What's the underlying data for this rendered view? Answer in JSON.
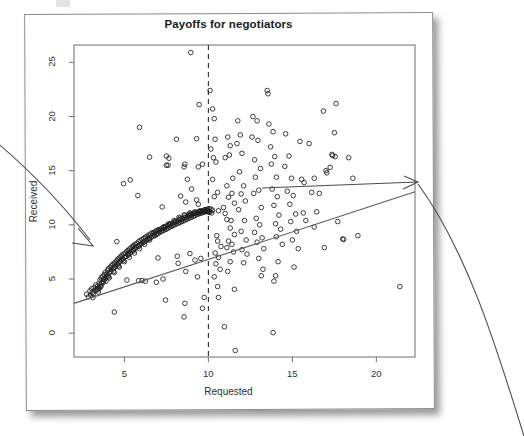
{
  "figure": {
    "title": "Payoffs for negotiators",
    "xlabel": "Requested",
    "ylabel": "Received"
  },
  "annotations": {
    "left_arrow_name": "arrow-pointing-to-dense-cluster",
    "right_arrow_name": "curved-arrow-pointing-to-regression-line"
  },
  "chart_data": {
    "type": "scatter",
    "title": "Payoffs for negotiators",
    "xlabel": "Requested",
    "ylabel": "Received",
    "xlim": [
      2.0,
      22.3
    ],
    "ylim": [
      -2.2,
      26.6
    ],
    "xticks": [
      5,
      10,
      15,
      20
    ],
    "yticks": [
      0,
      5,
      10,
      15,
      20,
      25
    ],
    "grid": false,
    "legend": null,
    "marker": "open-circle",
    "reference_lines": [
      {
        "name": "vertical-dashed-line",
        "orientation": "vertical",
        "x": 10,
        "style": "dashed",
        "color": "#2b2b2b"
      },
      {
        "name": "regression-line",
        "orientation": "linear-fit",
        "style": "solid",
        "color": "#5a5a5a",
        "x_from": 2.0,
        "y_from": 2.75,
        "x_to": 22.3,
        "y_to": 13.05
      }
    ],
    "points": [
      [
        2.75,
        3.6
      ],
      [
        2.85,
        3.35
      ],
      [
        2.95,
        3.9
      ],
      [
        3.0,
        3.5
      ],
      [
        3.05,
        4.1
      ],
      [
        3.1,
        3.75
      ],
      [
        3.12,
        3.3
      ],
      [
        3.2,
        4.2
      ],
      [
        3.25,
        3.95
      ],
      [
        3.3,
        4.45
      ],
      [
        3.35,
        4.05
      ],
      [
        3.4,
        4.35
      ],
      [
        3.45,
        3.8
      ],
      [
        3.5,
        4.6
      ],
      [
        3.52,
        4.15
      ],
      [
        3.55,
        4.9
      ],
      [
        3.6,
        4.4
      ],
      [
        3.62,
        5.1
      ],
      [
        3.65,
        4.6
      ],
      [
        3.7,
        5.25
      ],
      [
        3.72,
        4.8
      ],
      [
        3.75,
        5.0
      ],
      [
        3.8,
        5.4
      ],
      [
        3.82,
        4.95
      ],
      [
        3.85,
        5.6
      ],
      [
        3.9,
        5.2
      ],
      [
        3.95,
        5.45
      ],
      [
        4.0,
        5.8
      ],
      [
        4.02,
        5.3
      ],
      [
        4.05,
        5.95
      ],
      [
        4.1,
        5.55
      ],
      [
        4.15,
        6.05
      ],
      [
        4.2,
        5.7
      ],
      [
        4.22,
        6.2
      ],
      [
        4.25,
        5.9
      ],
      [
        4.3,
        6.35
      ],
      [
        4.35,
        6.0
      ],
      [
        4.4,
        6.4
      ],
      [
        4.42,
        6.1
      ],
      [
        4.45,
        6.55
      ],
      [
        4.5,
        6.2
      ],
      [
        4.55,
        6.7
      ],
      [
        4.6,
        6.35
      ],
      [
        4.62,
        6.85
      ],
      [
        4.65,
        6.5
      ],
      [
        4.7,
        6.95
      ],
      [
        4.75,
        6.6
      ],
      [
        4.8,
        7.05
      ],
      [
        4.82,
        6.75
      ],
      [
        4.85,
        7.2
      ],
      [
        4.9,
        6.85
      ],
      [
        4.95,
        7.3
      ],
      [
        5.0,
        7.0
      ],
      [
        5.05,
        7.4
      ],
      [
        5.1,
        7.1
      ],
      [
        5.15,
        7.55
      ],
      [
        5.2,
        7.25
      ],
      [
        5.22,
        7.65
      ],
      [
        5.25,
        7.35
      ],
      [
        5.3,
        7.75
      ],
      [
        5.35,
        7.45
      ],
      [
        5.4,
        7.9
      ],
      [
        5.45,
        7.6
      ],
      [
        5.5,
        8.0
      ],
      [
        5.52,
        7.7
      ],
      [
        5.55,
        8.1
      ],
      [
        5.6,
        7.8
      ],
      [
        5.65,
        8.2
      ],
      [
        5.7,
        7.95
      ],
      [
        5.75,
        8.3
      ],
      [
        5.8,
        8.05
      ],
      [
        5.85,
        8.45
      ],
      [
        5.9,
        8.15
      ],
      [
        5.95,
        8.55
      ],
      [
        6.0,
        8.25
      ],
      [
        6.05,
        8.65
      ],
      [
        6.1,
        8.35
      ],
      [
        6.15,
        8.75
      ],
      [
        6.2,
        8.45
      ],
      [
        6.25,
        8.85
      ],
      [
        6.3,
        8.55
      ],
      [
        6.35,
        8.95
      ],
      [
        6.4,
        8.65
      ],
      [
        6.45,
        9.05
      ],
      [
        6.5,
        8.75
      ],
      [
        6.55,
        9.15
      ],
      [
        6.6,
        8.85
      ],
      [
        6.65,
        9.25
      ],
      [
        6.7,
        8.95
      ],
      [
        6.75,
        9.3
      ],
      [
        6.8,
        9.05
      ],
      [
        6.85,
        9.4
      ],
      [
        6.9,
        9.1
      ],
      [
        6.95,
        9.5
      ],
      [
        7.0,
        9.2
      ],
      [
        7.05,
        9.55
      ],
      [
        7.1,
        9.3
      ],
      [
        7.15,
        9.6
      ],
      [
        7.2,
        9.4
      ],
      [
        7.25,
        9.7
      ],
      [
        7.3,
        9.45
      ],
      [
        7.35,
        9.8
      ],
      [
        7.4,
        9.55
      ],
      [
        7.45,
        9.85
      ],
      [
        7.5,
        9.6
      ],
      [
        7.55,
        9.95
      ],
      [
        7.6,
        9.7
      ],
      [
        7.65,
        10.0
      ],
      [
        7.7,
        9.8
      ],
      [
        7.75,
        10.05
      ],
      [
        7.8,
        9.85
      ],
      [
        7.85,
        10.15
      ],
      [
        7.9,
        9.95
      ],
      [
        7.95,
        10.2
      ],
      [
        8.0,
        10.0
      ],
      [
        8.05,
        10.3
      ],
      [
        8.1,
        10.1
      ],
      [
        8.15,
        10.35
      ],
      [
        8.2,
        10.15
      ],
      [
        8.25,
        10.45
      ],
      [
        8.3,
        10.2
      ],
      [
        8.35,
        10.5
      ],
      [
        8.4,
        10.3
      ],
      [
        8.45,
        10.55
      ],
      [
        8.5,
        10.35
      ],
      [
        8.55,
        10.65
      ],
      [
        8.6,
        10.45
      ],
      [
        8.65,
        10.7
      ],
      [
        8.7,
        10.5
      ],
      [
        8.75,
        10.8
      ],
      [
        8.8,
        10.6
      ],
      [
        8.85,
        10.85
      ],
      [
        8.9,
        10.65
      ],
      [
        8.95,
        10.9
      ],
      [
        9.0,
        10.7
      ],
      [
        9.05,
        11.0
      ],
      [
        9.1,
        10.8
      ],
      [
        9.15,
        11.05
      ],
      [
        9.2,
        10.85
      ],
      [
        9.25,
        11.1
      ],
      [
        9.3,
        10.95
      ],
      [
        9.35,
        11.15
      ],
      [
        9.4,
        11.0
      ],
      [
        9.45,
        11.2
      ],
      [
        9.5,
        11.05
      ],
      [
        9.55,
        11.25
      ],
      [
        9.6,
        11.1
      ],
      [
        9.65,
        11.3
      ],
      [
        9.7,
        11.15
      ],
      [
        9.75,
        11.35
      ],
      [
        9.8,
        11.2
      ],
      [
        9.85,
        11.4
      ],
      [
        9.9,
        11.25
      ],
      [
        9.95,
        11.45
      ],
      [
        10.0,
        11.3
      ],
      [
        10.05,
        11.5
      ],
      [
        10.1,
        11.2
      ],
      [
        10.15,
        11.45
      ],
      [
        10.2,
        11.1
      ],
      [
        10.25,
        11.35
      ],
      [
        3.4,
        4.0
      ],
      [
        3.6,
        4.3
      ],
      [
        3.9,
        4.8
      ],
      [
        4.1,
        5.1
      ],
      [
        4.4,
        5.6
      ],
      [
        4.7,
        6.1
      ],
      [
        5.0,
        6.6
      ],
      [
        5.3,
        7.0
      ],
      [
        5.6,
        7.4
      ],
      [
        5.9,
        7.8
      ],
      [
        6.2,
        8.2
      ],
      [
        6.5,
        8.6
      ],
      [
        6.8,
        9.0
      ],
      [
        7.1,
        9.4
      ],
      [
        7.4,
        9.7
      ],
      [
        7.7,
        10.0
      ],
      [
        8.0,
        10.3
      ],
      [
        8.3,
        10.6
      ],
      [
        8.6,
        10.9
      ],
      [
        8.9,
        11.1
      ],
      [
        9.2,
        11.2
      ],
      [
        9.5,
        11.3
      ],
      [
        9.8,
        11.4
      ],
      [
        10.0,
        11.2
      ],
      [
        3.15,
        3.6
      ],
      [
        3.45,
        4.2
      ],
      [
        3.75,
        4.7
      ],
      [
        4.05,
        5.2
      ],
      [
        4.35,
        5.7
      ],
      [
        4.65,
        6.2
      ],
      [
        4.95,
        6.7
      ],
      [
        5.25,
        7.2
      ],
      [
        5.55,
        7.6
      ],
      [
        5.85,
        8.0
      ],
      [
        6.15,
        8.4
      ],
      [
        6.45,
        8.8
      ],
      [
        6.75,
        9.2
      ],
      [
        7.05,
        9.5
      ],
      [
        7.35,
        9.8
      ],
      [
        7.65,
        10.1
      ],
      [
        7.95,
        10.4
      ],
      [
        8.25,
        10.7
      ],
      [
        8.55,
        10.9
      ],
      [
        8.85,
        11.0
      ],
      [
        9.15,
        11.1
      ],
      [
        9.45,
        11.2
      ],
      [
        9.75,
        11.25
      ],
      [
        10.05,
        11.15
      ],
      [
        4.55,
        8.45
      ],
      [
        4.4,
        1.95
      ],
      [
        5.15,
        4.9
      ],
      [
        5.85,
        4.85
      ],
      [
        6.05,
        4.85
      ],
      [
        6.25,
        4.8
      ],
      [
        4.95,
        13.8
      ],
      [
        5.35,
        14.15
      ],
      [
        5.8,
        12.7
      ],
      [
        5.9,
        19.0
      ],
      [
        6.5,
        16.25
      ],
      [
        7.0,
        6.95
      ],
      [
        7.25,
        11.65
      ],
      [
        7.5,
        16.35
      ],
      [
        7.65,
        16.15
      ],
      [
        7.5,
        15.5
      ],
      [
        7.6,
        15.5
      ],
      [
        6.9,
        4.7
      ],
      [
        7.3,
        5.0
      ],
      [
        7.45,
        3.05
      ],
      [
        8.15,
        7.1
      ],
      [
        8.2,
        6.45
      ],
      [
        8.35,
        12.65
      ],
      [
        8.1,
        17.9
      ],
      [
        8.6,
        15.6
      ],
      [
        8.55,
        15.35
      ],
      [
        8.65,
        12.1
      ],
      [
        8.95,
        25.9
      ],
      [
        8.9,
        7.35
      ],
      [
        8.65,
        5.7
      ],
      [
        8.6,
        2.75
      ],
      [
        8.55,
        1.5
      ],
      [
        8.95,
        11.0
      ],
      [
        9.0,
        13.3
      ],
      [
        8.75,
        14.2
      ],
      [
        9.3,
        17.95
      ],
      [
        9.45,
        21.1
      ],
      [
        9.65,
        15.6
      ],
      [
        9.4,
        15.35
      ],
      [
        9.3,
        12.3
      ],
      [
        9.4,
        11.9
      ],
      [
        9.2,
        6.75
      ],
      [
        9.55,
        6.9
      ],
      [
        9.35,
        5.2
      ],
      [
        9.65,
        2.3
      ],
      [
        9.75,
        3.3
      ],
      [
        10.1,
        22.4
      ],
      [
        10.35,
        19.8
      ],
      [
        10.25,
        20.7
      ],
      [
        10.4,
        17.9
      ],
      [
        10.15,
        17.0
      ],
      [
        10.3,
        16.2
      ],
      [
        10.45,
        15.8
      ],
      [
        10.25,
        14.2
      ],
      [
        10.55,
        13.0
      ],
      [
        10.35,
        12.6
      ],
      [
        10.6,
        11.3
      ],
      [
        10.9,
        11.6
      ],
      [
        10.5,
        9.0
      ],
      [
        10.55,
        8.5
      ],
      [
        10.75,
        8.0
      ],
      [
        10.4,
        7.4
      ],
      [
        10.6,
        7.0
      ],
      [
        10.45,
        6.4
      ],
      [
        10.7,
        5.9
      ],
      [
        10.35,
        5.2
      ],
      [
        10.55,
        4.3
      ],
      [
        10.6,
        3.3
      ],
      [
        10.95,
        0.6
      ],
      [
        11.0,
        11.05
      ],
      [
        11.1,
        10.5
      ],
      [
        11.35,
        10.4
      ],
      [
        11.15,
        18.1
      ],
      [
        11.3,
        17.3
      ],
      [
        11.25,
        16.45
      ],
      [
        11.0,
        16.2
      ],
      [
        11.45,
        14.3
      ],
      [
        11.1,
        13.6
      ],
      [
        11.4,
        12.9
      ],
      [
        11.2,
        12.55
      ],
      [
        11.55,
        12.0
      ],
      [
        11.3,
        9.7
      ],
      [
        11.55,
        9.1
      ],
      [
        11.2,
        8.5
      ],
      [
        11.4,
        8.2
      ],
      [
        11.1,
        7.9
      ],
      [
        11.5,
        7.5
      ],
      [
        11.3,
        6.6
      ],
      [
        11.15,
        5.7
      ],
      [
        11.55,
        4.05
      ],
      [
        11.6,
        -1.6
      ],
      [
        11.75,
        19.6
      ],
      [
        11.9,
        18.3
      ],
      [
        11.7,
        17.5
      ],
      [
        12.0,
        16.6
      ],
      [
        11.85,
        14.9
      ],
      [
        12.1,
        13.6
      ],
      [
        11.95,
        12.85
      ],
      [
        12.2,
        12.2
      ],
      [
        11.8,
        11.4
      ],
      [
        12.15,
        10.4
      ],
      [
        11.95,
        9.4
      ],
      [
        12.25,
        8.6
      ],
      [
        12.0,
        7.7
      ],
      [
        12.3,
        7.3
      ],
      [
        12.1,
        6.5
      ],
      [
        12.65,
        20.0
      ],
      [
        12.9,
        19.6
      ],
      [
        12.6,
        18.1
      ],
      [
        12.95,
        17.8
      ],
      [
        12.75,
        16.0
      ],
      [
        13.1,
        15.2
      ],
      [
        12.8,
        14.4
      ],
      [
        13.0,
        13.2
      ],
      [
        12.7,
        12.9
      ],
      [
        13.15,
        11.6
      ],
      [
        12.85,
        10.6
      ],
      [
        13.05,
        10.0
      ],
      [
        12.75,
        9.3
      ],
      [
        13.2,
        8.8
      ],
      [
        12.9,
        8.4
      ],
      [
        13.3,
        7.8
      ],
      [
        13.0,
        6.9
      ],
      [
        13.25,
        5.9
      ],
      [
        13.15,
        5.3
      ],
      [
        13.5,
        22.4
      ],
      [
        13.55,
        22.1
      ],
      [
        13.6,
        19.3
      ],
      [
        13.85,
        18.6
      ],
      [
        13.7,
        17.2
      ],
      [
        13.95,
        16.3
      ],
      [
        13.75,
        15.6
      ],
      [
        14.05,
        14.4
      ],
      [
        13.8,
        13.3
      ],
      [
        14.1,
        12.6
      ],
      [
        13.9,
        11.8
      ],
      [
        14.2,
        10.9
      ],
      [
        14.0,
        10.1
      ],
      [
        14.3,
        9.6
      ],
      [
        14.05,
        8.9
      ],
      [
        14.4,
        8.2
      ],
      [
        14.15,
        6.6
      ],
      [
        14.0,
        5.3
      ],
      [
        13.9,
        4.8
      ],
      [
        13.85,
        0.05
      ],
      [
        14.6,
        18.4
      ],
      [
        14.8,
        16.35
      ],
      [
        14.55,
        15.4
      ],
      [
        14.95,
        14.3
      ],
      [
        14.7,
        13.1
      ],
      [
        15.05,
        12.7
      ],
      [
        14.85,
        11.9
      ],
      [
        15.2,
        11.0
      ],
      [
        14.9,
        10.3
      ],
      [
        15.25,
        9.4
      ],
      [
        15.0,
        8.6
      ],
      [
        15.35,
        7.8
      ],
      [
        15.1,
        6.1
      ],
      [
        15.45,
        17.7
      ],
      [
        15.55,
        14.2
      ],
      [
        15.7,
        13.9
      ],
      [
        15.65,
        11.1
      ],
      [
        15.8,
        10.4
      ],
      [
        16.0,
        17.5
      ],
      [
        16.3,
        14.3
      ],
      [
        16.15,
        13.0
      ],
      [
        16.45,
        11.2
      ],
      [
        16.3,
        9.8
      ],
      [
        16.6,
        12.9
      ],
      [
        16.85,
        20.5
      ],
      [
        17.0,
        15.0
      ],
      [
        17.05,
        14.8
      ],
      [
        16.9,
        7.9
      ],
      [
        17.6,
        21.2
      ],
      [
        17.5,
        18.5
      ],
      [
        17.4,
        16.4
      ],
      [
        17.55,
        16.3
      ],
      [
        17.25,
        15.3
      ],
      [
        17.35,
        16.5
      ],
      [
        17.7,
        10.3
      ],
      [
        18.0,
        8.7
      ],
      [
        18.05,
        8.65
      ],
      [
        18.35,
        16.2
      ],
      [
        18.6,
        14.3
      ],
      [
        18.9,
        9.0
      ],
      [
        21.4,
        4.3
      ]
    ]
  }
}
